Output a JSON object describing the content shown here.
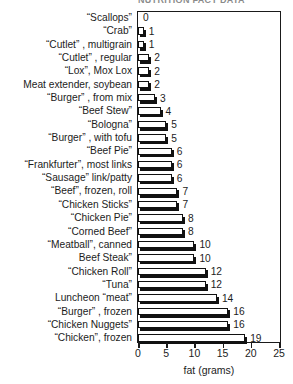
{
  "chart_data": {
    "type": "bar",
    "orientation": "horizontal",
    "title": "NUTRITION FACT DATA",
    "xlabel": "fat (grams)",
    "ylabel": "",
    "xlim": [
      0,
      25
    ],
    "xticks": [
      0,
      5,
      10,
      15,
      20,
      25
    ],
    "xtick_labels": [
      "0",
      "5",
      "10",
      "15",
      "20",
      "25"
    ],
    "grid": false,
    "legend": null,
    "show_value_labels": true,
    "categories": [
      "“Scallops”",
      "“Crab”",
      "“Cutlet” , multigrain",
      "“Cutlet” , regular",
      "“Lox”, Mox Lox",
      "Meat extender, soybean",
      "“Burger” , from mix",
      "“Beef Stew”",
      "“Bologna”",
      "“Burger” , with tofu",
      "“Beef Pie”",
      "“Frankfurter”, most links",
      "“Sausage” link/patty",
      "“Beef”, frozen, roll",
      "“Chicken Sticks”",
      "“Chicken Pie”",
      "“Corned Beef”",
      "“Meatball”, canned",
      "Beef Steak”",
      "“Chicken Roll”",
      "“Tuna”",
      "Luncheon “meat”",
      "“Burger” , frozen",
      "“Chicken Nuggets”",
      "“Chicken”, frozen"
    ],
    "values": [
      0,
      1,
      1,
      2,
      2,
      2,
      3,
      4,
      5,
      5,
      6,
      6,
      6,
      7,
      7,
      8,
      8,
      10,
      10,
      12,
      12,
      14,
      16,
      16,
      19
    ],
    "value_labels": [
      "0",
      "1",
      "1",
      "2",
      "2",
      "2",
      "3",
      "4",
      "5",
      "5",
      "6",
      "6",
      "6",
      "7",
      "7",
      "8",
      "8",
      "10",
      "10",
      "12",
      "12",
      "14",
      "16",
      "16",
      "19"
    ],
    "colors": {
      "bar_face": "#ffffff",
      "bar_edge": "#111111",
      "bar_shadow": "#111111",
      "axis": "#1a1a1a",
      "text": "#1c1c1c",
      "background": "#ffffff"
    }
  }
}
